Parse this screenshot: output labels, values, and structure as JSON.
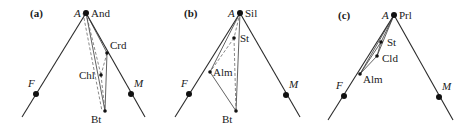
{
  "figure": {
    "panels": [
      {
        "id": "a",
        "label": "(a)",
        "label_pos": [
          30,
          17
        ],
        "apex": {
          "label": "A",
          "mineral": "And",
          "pos": [
            86,
            13
          ]
        },
        "left_vertex": {
          "label": "F",
          "pos": [
            36,
            94
          ],
          "line_end": [
            22,
            117
          ]
        },
        "right_vertex": {
          "label": "M",
          "pos": [
            131,
            94
          ],
          "line_end": [
            145,
            117
          ]
        },
        "phases": [
          {
            "name": "Crd",
            "pos": [
              107,
              53
            ],
            "label_offset": [
              3,
              -4
            ]
          },
          {
            "name": "Chl",
            "pos": [
              101,
              75
            ],
            "label_offset": [
              -22,
              4
            ]
          },
          {
            "name": "Bt",
            "pos": [
              105,
              111
            ],
            "label_offset": [
              -14,
              12
            ]
          }
        ],
        "solid_ties": [
          [
            "apex",
            "Crd"
          ],
          [
            "apex",
            "Bt"
          ],
          [
            "Crd",
            "Bt"
          ]
        ],
        "dashed_ties": [
          [
            "apex",
            "Chl"
          ],
          [
            "Crd",
            "Chl"
          ],
          [
            "Chl",
            "Bt"
          ],
          [
            "apex",
            "Bt2"
          ]
        ]
      },
      {
        "id": "b",
        "label": "(b)",
        "label_pos": [
          184,
          17
        ],
        "apex": {
          "label": "A",
          "mineral": "Sil",
          "pos": [
            240,
            13
          ]
        },
        "left_vertex": {
          "label": "F",
          "pos": [
            189,
            94
          ],
          "line_end": [
            175,
            117
          ]
        },
        "right_vertex": {
          "label": "M",
          "pos": [
            286,
            95
          ],
          "line_end": [
            300,
            117
          ]
        },
        "phases": [
          {
            "name": "St",
            "pos": [
              234,
              38
            ],
            "label_offset": [
              6,
              4
            ]
          },
          {
            "name": "Alm",
            "pos": [
              210,
              72
            ],
            "label_offset": [
              3,
              4
            ]
          },
          {
            "name": "Bt",
            "pos": [
              236,
              111
            ],
            "label_offset": [
              -14,
              12
            ]
          }
        ],
        "solid_ties": [
          [
            "apex",
            "Alm"
          ],
          [
            "apex",
            "Bt"
          ],
          [
            "Alm",
            "Bt"
          ]
        ],
        "dashed_ties": [
          [
            "apex",
            "St"
          ],
          [
            "St",
            "Alm"
          ],
          [
            "St",
            "Bt"
          ]
        ]
      },
      {
        "id": "c",
        "label": "(c)",
        "label_pos": [
          338,
          19
        ],
        "apex": {
          "label": "A",
          "mineral": "Prl",
          "pos": [
            394,
            15
          ]
        },
        "left_vertex": {
          "label": "F",
          "pos": [
            344,
            96
          ],
          "line_end": [
            328,
            120
          ]
        },
        "right_vertex": {
          "label": "M",
          "pos": [
            439,
            97
          ],
          "line_end": [
            453,
            120
          ]
        },
        "phases": [
          {
            "name": "St",
            "pos": [
              381,
              42
            ],
            "label_offset": [
              6,
              4
            ]
          },
          {
            "name": "Cld",
            "pos": [
              377,
              56
            ],
            "label_offset": [
              5,
              6
            ]
          },
          {
            "name": "Alm",
            "pos": [
              360,
              74
            ],
            "label_offset": [
              3,
              9
            ]
          }
        ],
        "solid_ties": [
          [
            "apex",
            "St"
          ],
          [
            "apex",
            "Cld"
          ],
          [
            "apex",
            "Alm"
          ],
          [
            "St",
            "Cld"
          ],
          [
            "Cld",
            "Alm"
          ],
          [
            "St",
            "Alm"
          ]
        ],
        "dashed_ties": []
      }
    ]
  }
}
